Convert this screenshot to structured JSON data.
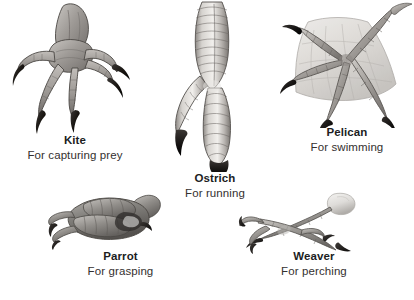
{
  "figure": {
    "background_color": "#ffffff",
    "text_color": "#201d1e",
    "subtext_color": "#34302f"
  },
  "specimens": [
    {
      "id": "kite",
      "name": "Kite",
      "function": "For capturing prey",
      "icon": "raptor-talon-foot-illustration"
    },
    {
      "id": "ostrich",
      "name": "Ostrich",
      "function": "For running",
      "icon": "didactyl-running-foot-illustration"
    },
    {
      "id": "pelican",
      "name": "Pelican",
      "function": "For swimming",
      "icon": "totipalmate-webbed-foot-illustration"
    },
    {
      "id": "parrot",
      "name": "Parrot",
      "function": "For grasping",
      "icon": "zygodactyl-grasping-foot-illustration"
    },
    {
      "id": "weaver",
      "name": "Weaver",
      "function": "For perching",
      "icon": "anisodactyl-perching-foot-illustration"
    }
  ]
}
